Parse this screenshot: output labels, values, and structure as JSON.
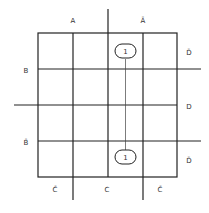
{
  "diagram": {
    "type": "karnaugh-map",
    "rows": 4,
    "cols": 4,
    "column_labels": {
      "top_left": "A",
      "top_right": "Ā",
      "bottom_left": "C̄",
      "bottom_center": "C",
      "bottom_right": "C̄"
    },
    "row_labels": {
      "left_upper": "B",
      "left_lower": "B̄",
      "right_row1": "D̄",
      "right_middle": "D",
      "right_row4": "D̄"
    },
    "cells": [
      {
        "row": 0,
        "col": 2,
        "value": "1"
      },
      {
        "row": 3,
        "col": 2,
        "value": "1"
      }
    ],
    "grouping": "vertical wrap-around link between the two 1 cells"
  }
}
